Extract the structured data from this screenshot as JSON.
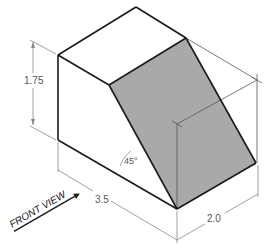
{
  "drawing": {
    "type": "isometric-technical-drawing",
    "shaded_color": "#a9a9a9",
    "line_color": "#1a1a1a",
    "dim_color": "#888888",
    "labels": {
      "height": "1.75",
      "length": "3.5",
      "depth": "2.0",
      "angle": "45°",
      "front_view": "FRONT VIEW"
    }
  }
}
